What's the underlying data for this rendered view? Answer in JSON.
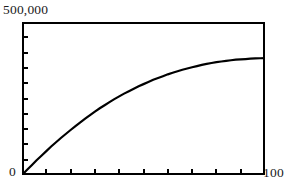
{
  "figure": {
    "background_color": "#ffffff",
    "ink_color": "#000000",
    "frame": {
      "border_width_px": 2,
      "left_px": 22,
      "top_px": 22,
      "width_px": 243,
      "height_px": 153
    }
  },
  "labels": {
    "y_max": "500,000",
    "y_min": "0",
    "x_max": "100"
  },
  "chart_data": {
    "type": "line",
    "title": "",
    "subtitle": "",
    "xlabel": "",
    "ylabel": "",
    "xlim": [
      0,
      100
    ],
    "ylim": [
      0,
      500000
    ],
    "xticks": [
      0,
      10,
      20,
      30,
      40,
      50,
      60,
      70,
      80,
      90,
      100
    ],
    "yticks": [
      0,
      50000,
      100000,
      150000,
      200000,
      250000,
      300000,
      350000,
      400000,
      450000,
      500000
    ],
    "xtick_labels": [
      "0",
      "",
      "",
      "",
      "",
      "",
      "",
      "",
      "",
      "",
      "100"
    ],
    "ytick_labels": [
      "0",
      "",
      "",
      "",
      "",
      "",
      "",
      "",
      "",
      "",
      "500,000"
    ],
    "tick_direction": "in",
    "tick_count_x": 10,
    "tick_count_y": 10,
    "grid": false,
    "legend": false,
    "legend_position": "none",
    "annotations": [],
    "series": [
      {
        "name": "cumulative growth",
        "color": "#000000",
        "line_width_px": 2.2,
        "shape": "saturating-growth",
        "x": [
          0,
          2,
          4,
          6,
          8,
          10,
          12,
          14,
          16,
          18,
          20,
          22,
          24,
          26,
          28,
          30,
          32,
          34,
          36,
          38,
          40,
          42,
          44,
          46,
          48,
          50,
          52,
          54,
          56,
          58,
          60,
          62,
          64,
          66,
          68,
          70,
          72,
          74,
          76,
          78,
          80,
          82,
          84,
          86,
          88,
          90,
          92,
          94,
          96,
          98,
          100
        ],
        "values": [
          0,
          16000,
          32000,
          48000,
          63000,
          78000,
          93000,
          107000,
          121000,
          134000,
          147000,
          160000,
          172000,
          184000,
          196000,
          207000,
          218000,
          228000,
          238000,
          248000,
          257000,
          266000,
          274000,
          282000,
          290000,
          297000,
          304000,
          311000,
          317000,
          323000,
          329000,
          334000,
          339000,
          344000,
          348000,
          352000,
          356000,
          360000,
          363000,
          366000,
          369000,
          371000,
          373000,
          375000,
          377000,
          378000,
          379000,
          380000,
          381000,
          381500,
          382000
        ]
      }
    ]
  }
}
